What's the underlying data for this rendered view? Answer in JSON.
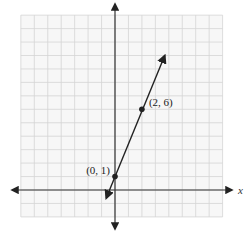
{
  "chart_data": {
    "type": "line",
    "title": "",
    "xlabel": "x",
    "ylabel": "y",
    "xlim": [
      -7,
      8
    ],
    "ylim": [
      -2,
      13
    ],
    "grid": true,
    "grid_step": 1,
    "axes_arrows": true,
    "line": {
      "equation": "y = 2.5x + 1",
      "slope": 2.5,
      "intercept": 1,
      "arrow_start": [
        -0.65,
        -0.6
      ],
      "arrow_end": [
        3.7,
        10.0
      ],
      "color": "#222222"
    },
    "points": [
      {
        "x": 0,
        "y": 1,
        "label": "(0, 1)",
        "label_position": "left"
      },
      {
        "x": 2,
        "y": 6,
        "label": "(2, 6)",
        "label_position": "right"
      }
    ],
    "legend": null
  },
  "colors": {
    "grid": "#d4d4d4",
    "grid_bg": "#f7f7f7",
    "axis": "#333333",
    "line": "#222222",
    "point": "#222222"
  }
}
